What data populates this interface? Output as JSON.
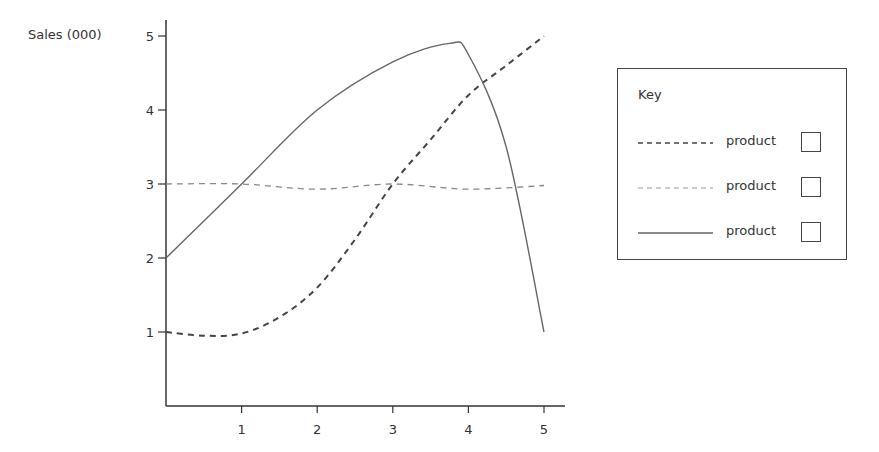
{
  "chart_data": {
    "type": "line",
    "title": "",
    "xlabel": "",
    "ylabel": "Sales (000)",
    "xlim": [
      0,
      5.2
    ],
    "ylim": [
      0,
      5
    ],
    "x_ticks": [
      "1",
      "2",
      "3",
      "4",
      "5"
    ],
    "y_ticks": [
      "1",
      "2",
      "3",
      "4",
      "5"
    ],
    "grid": false,
    "legend_position": "right",
    "series": [
      {
        "name": "product",
        "style": "dashed-dark",
        "x": [
          0,
          0.5,
          1,
          1.5,
          2,
          2.5,
          3,
          3.5,
          4,
          4.5,
          5
        ],
        "values": [
          1.0,
          0.95,
          0.98,
          1.2,
          1.6,
          2.25,
          3.0,
          3.6,
          4.2,
          4.6,
          5.0
        ]
      },
      {
        "name": "product",
        "style": "dashed-light",
        "x": [
          0,
          1,
          2,
          3,
          4,
          5
        ],
        "values": [
          3.0,
          3.0,
          2.93,
          3.0,
          2.93,
          2.98
        ]
      },
      {
        "name": "product",
        "style": "solid",
        "x": [
          0,
          1,
          2,
          3,
          3.75,
          4,
          4.5,
          5
        ],
        "values": [
          2.0,
          3.0,
          4.0,
          4.65,
          4.9,
          4.75,
          3.5,
          1.0
        ]
      }
    ]
  },
  "axis": {
    "ylabel": "Sales (000)",
    "x_ticks": [
      "1",
      "2",
      "3",
      "4",
      "5"
    ],
    "y_ticks": [
      "1",
      "2",
      "3",
      "4",
      "5"
    ]
  },
  "legend": {
    "title": "Key",
    "items": [
      {
        "label": "product",
        "style": "dashed-dark"
      },
      {
        "label": "product",
        "style": "dashed-light"
      },
      {
        "label": "product",
        "style": "solid"
      }
    ]
  },
  "colors": {
    "axis": "#333333",
    "dashed_dark": "#444444",
    "dashed_light": "#888888",
    "solid": "#666666"
  }
}
